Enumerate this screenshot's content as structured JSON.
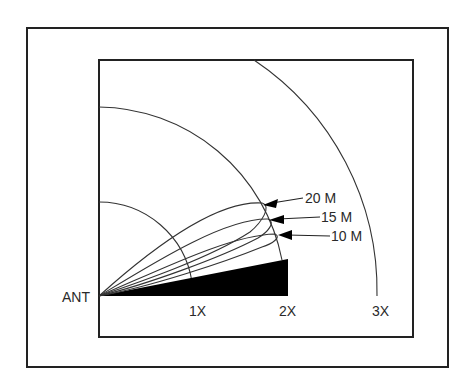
{
  "figure": {
    "type": "antenna-radiation-pattern",
    "origin_label": "ANT",
    "range_labels": [
      "1X",
      "2X",
      "3X"
    ],
    "lobes": [
      {
        "label": "20 M",
        "peak_x": 264,
        "peak_y": 204
      },
      {
        "label": "15 M",
        "peak_x": 270,
        "peak_y": 220
      },
      {
        "label": "10 M",
        "peak_x": 277,
        "peak_y": 236
      }
    ],
    "colors": {
      "line": "#333333",
      "ground": "#000000",
      "frame": "#222222",
      "background": "#ffffff"
    }
  }
}
